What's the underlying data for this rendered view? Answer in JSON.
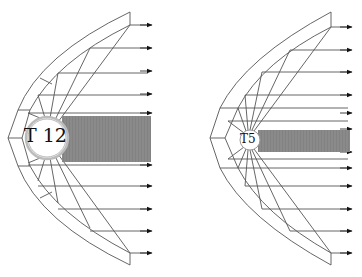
{
  "diagram": {
    "left": {
      "lamp_label": "T 12",
      "lamp_center": [
        47,
        138
      ],
      "lamp_radius": 20,
      "shadow_band": {
        "x1": 62,
        "x2": 151,
        "y1": 116,
        "y2": 162
      },
      "arrow_rows": [
        25,
        48,
        71,
        94,
        113,
        165,
        186,
        209,
        231,
        253
      ]
    },
    "right": {
      "lamp_label": "T5",
      "lamp_center": [
        250,
        140
      ],
      "lamp_radius": 10,
      "shadow_band": {
        "x1": 258,
        "x2": 350,
        "y1": 130,
        "y2": 152
      },
      "arrow_rows": [
        27,
        50,
        72,
        95,
        113,
        129,
        152,
        168,
        186,
        209,
        231,
        253
      ]
    },
    "colors": {
      "line": "#555555",
      "arrow": "#111111",
      "shadow": "#8a8a8a",
      "lamp_ring": "#bbbbbb"
    }
  }
}
